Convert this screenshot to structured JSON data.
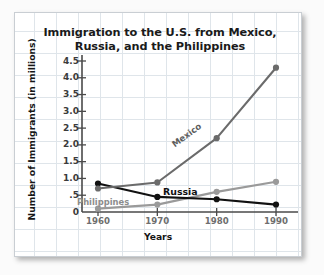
{
  "chart_data": {
    "type": "line",
    "title": "Immigration to the U.S. from Mexico, Russia, and the Philippines",
    "title_line1": "Immigration to the U.S. from Mexico,",
    "title_line2": "Russia, and the Philippines",
    "xlabel": "Years",
    "ylabel": "Number of Immigrants (in millions)",
    "x": [
      1960,
      1970,
      1980,
      1990
    ],
    "xticklabels": [
      "1960",
      "1970",
      "1980",
      "1990"
    ],
    "yticklabels": [
      "0",
      ".5",
      "1.0",
      "1.5",
      "2.0",
      "2.5",
      "3.0",
      "3.5",
      "4.0",
      "4.5"
    ],
    "ytickvalues": [
      0,
      0.5,
      1.0,
      1.5,
      2.0,
      2.5,
      3.0,
      3.5,
      4.0,
      4.5
    ],
    "ylim": [
      0,
      4.5
    ],
    "xlim": [
      1955,
      1995
    ],
    "grid": true,
    "legend": "inline-series-labels",
    "series": [
      {
        "name": "Mexico",
        "values": [
          0.7,
          0.88,
          2.2,
          4.3
        ],
        "color": "#6b6b6b",
        "label_color": "#5d5d5d"
      },
      {
        "name": "Russia",
        "values": [
          0.85,
          0.45,
          0.38,
          0.22
        ],
        "color": "#111111",
        "label_color": "#111111"
      },
      {
        "name": "Philippines",
        "values": [
          0.1,
          0.22,
          0.6,
          0.9
        ],
        "color": "#9a9a9a",
        "label_color": "#8d8d8d"
      }
    ],
    "axis_color": "#4a4a4a",
    "grid_color": "#dfe5ea",
    "background_color": "#ffffff"
  }
}
